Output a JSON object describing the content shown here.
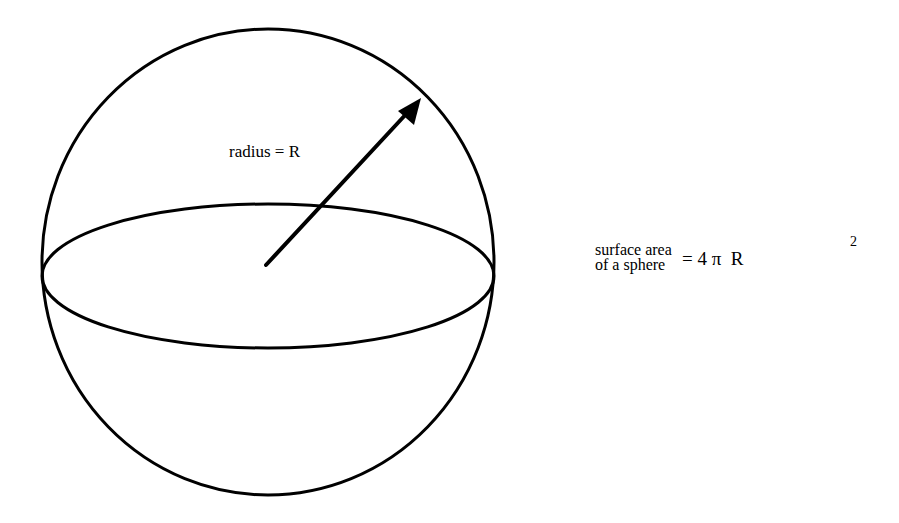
{
  "diagram": {
    "title": "Surface area of a sphere",
    "radius_label": "radius = R",
    "formula": {
      "lhs_line1": "surface area",
      "lhs_line2": "of a sphere",
      "rhs": "= 4 π  R",
      "exponent": "2"
    },
    "shapes": {
      "sphere_outline": {
        "cx": 268,
        "cy": 262,
        "rx": 226,
        "ry": 233
      },
      "equator_ellipse": {
        "cx": 268,
        "cy": 276,
        "rx": 226,
        "ry": 72
      },
      "radius_arrow": {
        "x1": 266,
        "y1": 265,
        "x2": 421,
        "y2": 98
      }
    },
    "colors": {
      "stroke": "#000000",
      "background": "#ffffff"
    }
  }
}
